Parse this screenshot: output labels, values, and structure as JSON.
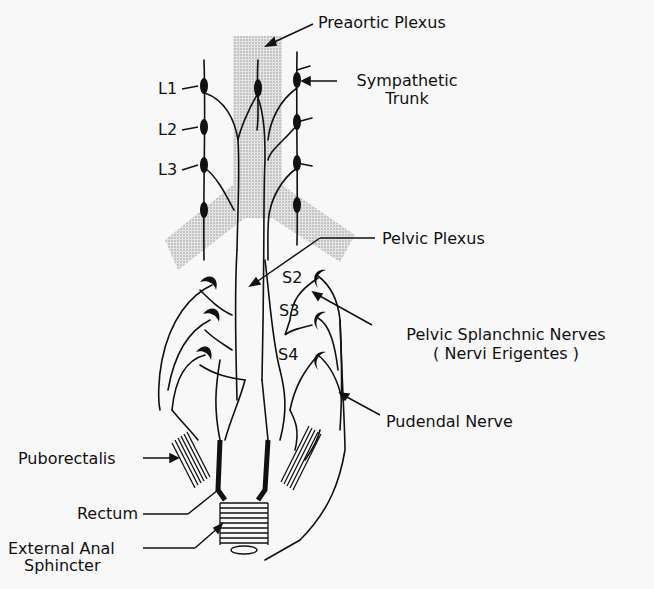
{
  "labels": {
    "preaortic_plexus": "Preaortic Plexus",
    "sympathetic_trunk_1": "Sympathetic",
    "sympathetic_trunk_2": "Trunk",
    "l1": "L1",
    "l2": "L2",
    "l3": "L3",
    "pelvic_plexus": "Pelvic Plexus",
    "s2": "S2",
    "s3": "S3",
    "s4": "S4",
    "pelvic_splanchnic_1": "Pelvic Splanchnic Nerves",
    "pelvic_splanchnic_2": "( Nervi Erigentes )",
    "pudendal_nerve": "Pudendal Nerve",
    "puborectalis": "Puborectalis",
    "rectum": "Rectum",
    "external_anal_1": "External Anal",
    "external_anal_2": "Sphincter"
  },
  "colors": {
    "ink": "#111111",
    "stipple": "#c8c8c8",
    "background": "#f8f8f8"
  }
}
